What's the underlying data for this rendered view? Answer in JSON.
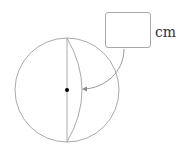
{
  "diagram": {
    "type": "sphere",
    "unit": "cm",
    "answer_box_value": "",
    "colors": {
      "outline": "#aaaaaa",
      "center_dot": "#000000",
      "arrow": "#999999"
    }
  }
}
